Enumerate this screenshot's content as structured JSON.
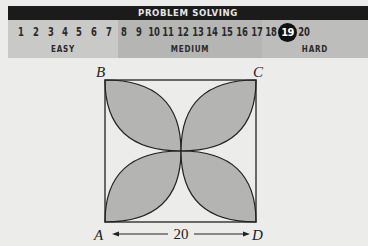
{
  "header": {
    "title": "PROBLEM SOLVING",
    "difficulty_bands": [
      {
        "label": "EASY",
        "from": 1,
        "to": 6
      },
      {
        "label": "MEDIUM",
        "from": 7,
        "to": 14
      },
      {
        "label": "HARD",
        "from": 15,
        "to": 20
      }
    ],
    "question_numbers": [
      "1",
      "2",
      "3",
      "4",
      "5",
      "6",
      "7",
      "8",
      "9",
      "10",
      "11",
      "12",
      "13",
      "14",
      "15",
      "16",
      "17",
      "18",
      "19",
      "20"
    ],
    "current_question": "19"
  },
  "figure": {
    "vertices": {
      "A": "A",
      "B": "B",
      "C": "C",
      "D": "D"
    },
    "side_label": "20",
    "colors": {
      "fill": "#b4b4b2",
      "stroke": "#222222"
    }
  }
}
